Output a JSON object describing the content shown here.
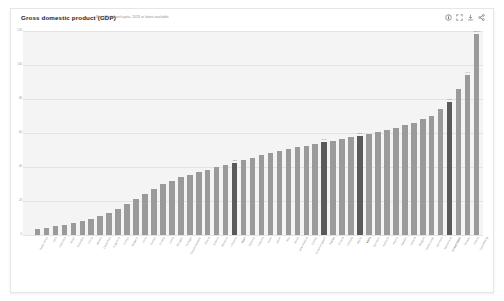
{
  "header": {
    "title": "Gross domestic product (GDP)",
    "subtitle": "Mio. US dollars/capita, 2023 or latest available",
    "tools": [
      {
        "name": "info-icon",
        "label": "Info"
      },
      {
        "name": "expand-icon",
        "label": "Expand"
      },
      {
        "name": "download-icon",
        "label": "Download"
      },
      {
        "name": "share-icon",
        "label": "Share"
      }
    ]
  },
  "chart_data": {
    "type": "bar",
    "title": "Gross domestic product (GDP)",
    "subtitle": "Mio. US dollars/capita, 2023 or latest available",
    "xlabel": "",
    "ylabel": "",
    "ylim": [
      0,
      120
    ],
    "yticks": [
      0,
      20,
      40,
      60,
      80,
      100,
      120
    ],
    "ytick_labels": [
      "0",
      "20",
      "40",
      "60",
      "80",
      "100",
      "120"
    ],
    "grid": true,
    "legend": "none",
    "sorted": "ascending",
    "bar_color": "#9a9a9a",
    "highlight_color": "#5a5a5a",
    "categories": [
      "South Africa",
      "India",
      "Indonesia",
      "Brazil",
      "Colombia",
      "China",
      "Mexico",
      "Costa Rica",
      "Argentina",
      "Türkiye",
      "Bulgaria",
      "Chile",
      "Greece",
      "Croatia",
      "Latvia",
      "Hungary",
      "Portugal",
      "Slovak Republic",
      "Poland",
      "Estonia",
      "Romania",
      "Lithuania",
      "Spain",
      "Slovenia",
      "Czechia",
      "Israel",
      "Japan",
      "Italy",
      "Korea",
      "New Zealand",
      "Cyprus",
      "United Kingdom",
      "France",
      "Finland",
      "Canada",
      "OECD",
      "Malta",
      "Germany",
      "Australia",
      "Austria",
      "Sweden",
      "Iceland",
      "Belgium",
      "Netherlands",
      "Denmark",
      "Switzerland",
      "United States",
      "Norway",
      "Ireland",
      "Luxembourg"
    ],
    "values": [
      3.5,
      4.2,
      5.1,
      6.0,
      6.8,
      8.0,
      9.5,
      11.0,
      13.0,
      15.5,
      18.0,
      21.0,
      24.0,
      27.0,
      30.0,
      32.0,
      34.0,
      35.5,
      37.0,
      38.5,
      40.0,
      41.0,
      42.5,
      44.0,
      45.5,
      47.0,
      48.0,
      49.5,
      50.5,
      51.5,
      52.5,
      53.5,
      54.5,
      55.5,
      56.5,
      57.5,
      58.5,
      59.5,
      60.5,
      61.5,
      63.0,
      64.5,
      66.0,
      68.0,
      70.0,
      74.0,
      78.0,
      86.0,
      94.0,
      118.0
    ],
    "highlighted_indices": [
      22,
      32,
      36,
      46
    ],
    "value_labels": {
      "22": "42.5",
      "32": "54.5",
      "36": "58.5",
      "46": "78.0",
      "48": "94.0",
      "49": "118.0"
    }
  }
}
